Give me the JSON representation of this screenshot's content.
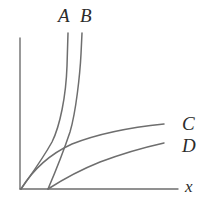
{
  "figure": {
    "title": "",
    "type": "growth-rate-comparison-plot",
    "background_color": "#ffffff",
    "stroke_color": "#6e6e6e",
    "axis_color": "#6e6e6e",
    "label_color": "#2b2b2b"
  },
  "axes": {
    "x_axis_label": "x",
    "y_axis_label": "",
    "origin": {
      "x": 20,
      "y": 189
    },
    "x_axis_end": {
      "x": 178,
      "y": 189
    },
    "y_axis_top": {
      "x": 20,
      "y": 38
    },
    "show_ticks": false,
    "show_grid": false
  },
  "curves": [
    {
      "id": "A",
      "label": "A",
      "label_position": {
        "x": 58,
        "y": 6
      },
      "shape": "steep-exponential",
      "starts_at_origin": true,
      "path": "M 21,189 C 30,176 42,160 52,142 C 60,126 66,96 67,66 L 68,33"
    },
    {
      "id": "B",
      "label": "B",
      "label_position": {
        "x": 80,
        "y": 6
      },
      "shape": "steep-exponential-shifted",
      "starts_at_origin": false,
      "x_intercept": 48,
      "path": "M 48,189 C 54,175 62,156 70,132 C 76,112 80,74 81,54 L 82,33"
    },
    {
      "id": "C",
      "label": "C",
      "label_position": {
        "x": 182,
        "y": 114
      },
      "shape": "logarithmic",
      "starts_at_origin": true,
      "path": "M 21,189 C 34,168 50,154 72,144 C 100,133 134,127 164,124"
    },
    {
      "id": "D",
      "label": "D",
      "label_position": {
        "x": 182,
        "y": 136
      },
      "shape": "logarithmic-shifted",
      "starts_at_origin": false,
      "x_intercept": 48,
      "path": "M 48,189 C 62,180 80,170 100,162 C 124,153 146,147 164,143"
    }
  ],
  "annotations": {
    "x_label": "x"
  }
}
